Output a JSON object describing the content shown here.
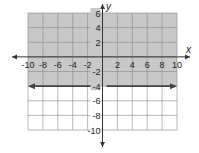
{
  "chart_data": {
    "type": "line",
    "title": "",
    "xlabel": "x",
    "ylabel": "y",
    "xlim": [
      -10,
      10
    ],
    "ylim": [
      -10,
      6
    ],
    "grid": true,
    "grid_step": 2,
    "x_ticks": [
      "-10",
      "-8",
      "-6",
      "-4",
      "-2",
      "2",
      "4",
      "6",
      "8",
      "10"
    ],
    "y_ticks": [
      "6",
      "4",
      "2",
      "-2",
      "-4",
      "-6",
      "-8",
      "-10"
    ],
    "series": [
      {
        "name": "boundary line y = -4",
        "style": "solid, arrows both ends",
        "points": [
          [
            -10,
            -4
          ],
          [
            10,
            -4
          ]
        ]
      }
    ],
    "shaded_region": {
      "description": "y > -4",
      "from_y": -4,
      "to_y": 6,
      "color": "#c8c8c8"
    },
    "colors": {
      "shade": "#c8c8c8",
      "grid": "#8a8a8a",
      "line": "#444444",
      "axis": "#333333"
    }
  }
}
